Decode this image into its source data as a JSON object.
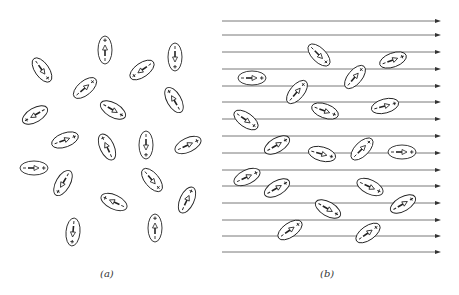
{
  "figure": {
    "panel_a": {
      "label": "(a)",
      "description": "Randomly oriented dipoles, no applied field",
      "dipoles": [
        {
          "x": 105,
          "y": 50,
          "angle": -90
        },
        {
          "x": 175,
          "y": 57,
          "angle": 90
        },
        {
          "x": 42,
          "y": 70,
          "angle": 55
        },
        {
          "x": 142,
          "y": 70,
          "angle": 145
        },
        {
          "x": 85,
          "y": 88,
          "angle": -40
        },
        {
          "x": 174,
          "y": 100,
          "angle": -120
        },
        {
          "x": 35,
          "y": 115,
          "angle": 150
        },
        {
          "x": 113,
          "y": 110,
          "angle": 30
        },
        {
          "x": 65,
          "y": 140,
          "angle": -20
        },
        {
          "x": 107,
          "y": 147,
          "angle": -115
        },
        {
          "x": 146,
          "y": 145,
          "angle": 90
        },
        {
          "x": 188,
          "y": 145,
          "angle": -25
        },
        {
          "x": 34,
          "y": 168,
          "angle": 0
        },
        {
          "x": 63,
          "y": 183,
          "angle": 120
        },
        {
          "x": 152,
          "y": 180,
          "angle": 50
        },
        {
          "x": 114,
          "y": 202,
          "angle": -155
        },
        {
          "x": 187,
          "y": 200,
          "angle": -65
        },
        {
          "x": 73,
          "y": 232,
          "angle": 95
        },
        {
          "x": 155,
          "y": 228,
          "angle": -90
        }
      ]
    },
    "panel_b": {
      "label": "(b)",
      "description": "Dipoles partially aligned with applied field",
      "field_lines": {
        "x_start": 222,
        "x_end": 441,
        "y_values": [
          21,
          35,
          52,
          69,
          86,
          102,
          119,
          136,
          153,
          170,
          186,
          203,
          220,
          236,
          252
        ]
      },
      "dipoles": [
        {
          "x": 319,
          "y": 55,
          "angle": 45
        },
        {
          "x": 252,
          "y": 78,
          "angle": 0
        },
        {
          "x": 393,
          "y": 60,
          "angle": -20
        },
        {
          "x": 355,
          "y": 77,
          "angle": -50
        },
        {
          "x": 297,
          "y": 92,
          "angle": -50
        },
        {
          "x": 325,
          "y": 111,
          "angle": 20
        },
        {
          "x": 385,
          "y": 106,
          "angle": -15
        },
        {
          "x": 246,
          "y": 120,
          "angle": 35
        },
        {
          "x": 277,
          "y": 145,
          "angle": -30
        },
        {
          "x": 322,
          "y": 154,
          "angle": 15
        },
        {
          "x": 362,
          "y": 149,
          "angle": -45
        },
        {
          "x": 402,
          "y": 152,
          "angle": 0
        },
        {
          "x": 247,
          "y": 177,
          "angle": -25
        },
        {
          "x": 277,
          "y": 188,
          "angle": -30
        },
        {
          "x": 370,
          "y": 187,
          "angle": 25
        },
        {
          "x": 328,
          "y": 209,
          "angle": 30
        },
        {
          "x": 403,
          "y": 204,
          "angle": -30
        },
        {
          "x": 290,
          "y": 230,
          "angle": -35
        },
        {
          "x": 368,
          "y": 233,
          "angle": -35
        }
      ]
    },
    "dipole_style": {
      "rx": 14,
      "ry": 7,
      "stroke": "#222222",
      "negative_sign": "−",
      "positive_sign": "+"
    },
    "colors": {
      "line": "#555555",
      "background": "#ffffff"
    }
  }
}
